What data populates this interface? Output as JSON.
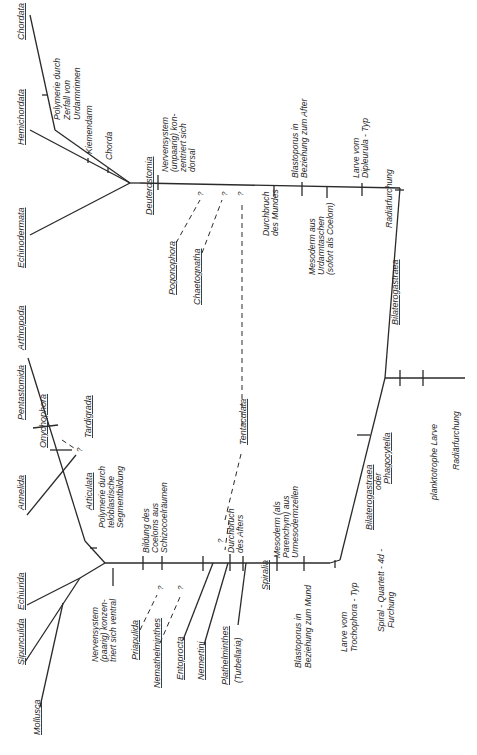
{
  "diagram": {
    "orientation": "rotated 90 degrees counter-clockwise",
    "taxa": {
      "chordata": "Chordata",
      "hemichordata": "Hemichordata",
      "echinodermata": "Echinodermata",
      "deuterostomia": "Deuterostomia",
      "pogonophora": "Pogonophora",
      "chaetognatha": "Chaetognatha",
      "tentaculata": "Tentaculata",
      "arthropoda": "Arthropoda",
      "pentastomida": "Pentastomida",
      "tardigrada": "Tardigrada",
      "onychophora": "Onychophora",
      "annelida": "Annelida",
      "articulata": "Articulata",
      "echiurida": "Echiurida",
      "sipunculida": "Sipunculida",
      "mollusca": "Mollusca",
      "priapulida": "Priapulida",
      "nemathelminthes": "Nemathelminthes",
      "entoprocta": "Entoprocta",
      "nemertini": "Nemertini",
      "plathelminthes": "Plathelminthes",
      "turbellaria": "(Turbellaria)",
      "spiralia": "Spiralia",
      "bilaterogastraea": "Bilaterogastraea",
      "bilaterogastraea_2": "Bilaterogastraea",
      "oder": "oder",
      "phagocytella": "Phagocytella"
    },
    "characters": {
      "polymerie_urdarm": [
        "Polymerie durch",
        "Zerfall von",
        "Urdarmrinnen"
      ],
      "kiemendarm": "Kiemendarm",
      "chorda": "Chorda",
      "nervensystem_dorsal": [
        "Nervensystem",
        "(unpaarig) kon-",
        "zentriert sich",
        "dorsal"
      ],
      "blastoporus_after": [
        "Blastoporus in",
        "Beziehung zum After"
      ],
      "larve_dipleurula": [
        "Larve vom",
        "Dipleurula - Typ"
      ],
      "radiaerfurchung_1": "Radiärfurchung",
      "durchbruch_mund": [
        "Durchbruch",
        "des Mundes"
      ],
      "mesoderm_coelom": [
        "Mesoderm aus",
        "Urdarmtaschen",
        "(sofort als Coelom)"
      ],
      "polymerie_teloblast": [
        "Polymerie durch",
        "teloblastische",
        "Segmentbildung"
      ],
      "bildung_coelom": [
        "Bildung des",
        "Coeloms aus",
        "Schizocoelräumen"
      ],
      "durchbruch_after": [
        "Durchbruch",
        "des Afters"
      ],
      "nervensystem_ventral": [
        "Nervensystem",
        "(paarig) konzen-",
        "triert sich ventral"
      ],
      "blastoporus_mund": [
        "Blastoporus in",
        "Beziehung zum Mund"
      ],
      "mesoderm_parenchym": [
        "Mesoderm (als",
        "Parenchym) aus",
        "Urmesodermzellen"
      ],
      "larve_trochophora": [
        "Larve vom",
        "Trochophora - Typ"
      ],
      "spiral_quartett": [
        "Spiral - Quartett - 4d -",
        "Furchung"
      ],
      "planktotrophe_larve": "planktotrophe Larve",
      "radiaerfurchung_2": "Radiärfurchung"
    },
    "uncertain_marker": "?"
  }
}
